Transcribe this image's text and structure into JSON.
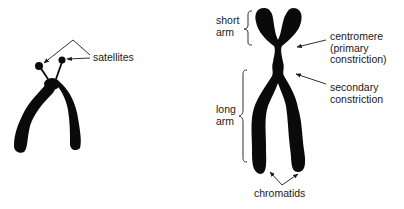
{
  "figure": {
    "left_chromosome": {
      "type": "acrocentric chromosome with satellites",
      "labels": {
        "satellites": "satellites"
      }
    },
    "right_chromosome": {
      "type": "replicated chromosome",
      "labels": {
        "short_arm": "short\narm",
        "long_arm": "long\narm",
        "centromere": "centromere\n(primary\nconstriction)",
        "secondary_constriction": "secondary\nconstriction",
        "chromatids": "chromatids"
      }
    },
    "colors": {
      "ink": "#0a0a0a",
      "background": "#ffffff",
      "text": "#1a1a1a"
    }
  }
}
